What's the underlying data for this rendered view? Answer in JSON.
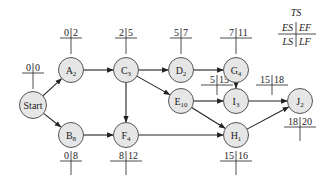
{
  "legend": {
    "top": "TS",
    "es": "ES",
    "ef": "EF",
    "ls": "LS",
    "lf": "LF"
  },
  "nodes": [
    {
      "id": "start",
      "name": "Start",
      "sub": "",
      "x": 33,
      "y": 105,
      "es": "0",
      "ef": "0",
      "label_pos": "above"
    },
    {
      "id": "A",
      "name": "A",
      "sub": "2",
      "x": 71,
      "y": 70,
      "es": "0",
      "ef": "2",
      "label_pos": "above"
    },
    {
      "id": "B",
      "name": "B",
      "sub": "8",
      "x": 71,
      "y": 135,
      "es": "0",
      "ef": "8",
      "label_pos": "below"
    },
    {
      "id": "C",
      "name": "C",
      "sub": "3",
      "x": 126,
      "y": 70,
      "es": "2",
      "ef": "5",
      "label_pos": "above"
    },
    {
      "id": "D",
      "name": "D",
      "sub": "2",
      "x": 181,
      "y": 70,
      "es": "5",
      "ef": "7",
      "label_pos": "above"
    },
    {
      "id": "E",
      "name": "E",
      "sub": "10",
      "x": 181,
      "y": 101,
      "es": "5",
      "ef": "15",
      "label_pos": "above-right"
    },
    {
      "id": "F",
      "name": "F",
      "sub": "4",
      "x": 126,
      "y": 135,
      "es": "8",
      "ef": "12",
      "label_pos": "below"
    },
    {
      "id": "G",
      "name": "G",
      "sub": "4",
      "x": 236,
      "y": 70,
      "es": "7",
      "ef": "11",
      "label_pos": "above"
    },
    {
      "id": "H",
      "name": "H",
      "sub": "1",
      "x": 236,
      "y": 135,
      "es": "15",
      "ef": "16",
      "label_pos": "below"
    },
    {
      "id": "I",
      "name": "I",
      "sub": "3",
      "x": 236,
      "y": 101,
      "es": "15",
      "ef": "18",
      "label_pos": "above-right"
    },
    {
      "id": "J",
      "name": "J",
      "sub": "2",
      "x": 300,
      "y": 101,
      "es": "18",
      "ef": "20",
      "label_pos": "below"
    }
  ],
  "edges": [
    [
      "start",
      "A"
    ],
    [
      "start",
      "B"
    ],
    [
      "A",
      "C"
    ],
    [
      "B",
      "F"
    ],
    [
      "C",
      "D"
    ],
    [
      "C",
      "E"
    ],
    [
      "C",
      "F"
    ],
    [
      "D",
      "G"
    ],
    [
      "G",
      "I"
    ],
    [
      "E",
      "I"
    ],
    [
      "E",
      "H"
    ],
    [
      "F",
      "H"
    ],
    [
      "I",
      "J"
    ],
    [
      "H",
      "J"
    ]
  ]
}
